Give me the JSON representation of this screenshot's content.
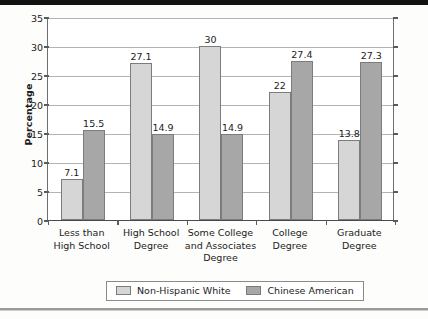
{
  "chart_data": {
    "type": "bar",
    "title": "",
    "xlabel": "",
    "ylabel": "Percentage",
    "ylim": [
      0,
      35
    ],
    "yticks": [
      0,
      5,
      10,
      15,
      20,
      25,
      30,
      35
    ],
    "grid": true,
    "legend_position": "bottom",
    "categories": [
      "Less than\nHigh School",
      "High School\nDegree",
      "Some College\nand Associates\nDegree",
      "College\nDegree",
      "Graduate\nDegree"
    ],
    "category_lines": [
      [
        "Less than",
        "High School"
      ],
      [
        "High School",
        "Degree"
      ],
      [
        "Some College",
        "and Associates",
        "Degree"
      ],
      [
        "College",
        "Degree"
      ],
      [
        "Graduate",
        "Degree"
      ]
    ],
    "series": [
      {
        "name": "Non-Hispanic White",
        "color": "#d6d6d6",
        "values": [
          7.1,
          27.1,
          30,
          22,
          13.8
        ],
        "labels": [
          "7.1",
          "27.1",
          "30",
          "22",
          "13.8"
        ]
      },
      {
        "name": "Chinese American",
        "color": "#a7a7a7",
        "values": [
          15.5,
          14.9,
          14.9,
          27.4,
          27.3
        ],
        "labels": [
          "15.5",
          "14.9",
          "14.9",
          "27.4",
          "27.3"
        ]
      }
    ]
  },
  "colors": {
    "series_non_hispanic_white": "#d6d6d6",
    "series_chinese_american": "#a7a7a7",
    "gridline": "#b3b3b3",
    "axis": "#5a5a5a",
    "text": "#1c1c1c"
  }
}
